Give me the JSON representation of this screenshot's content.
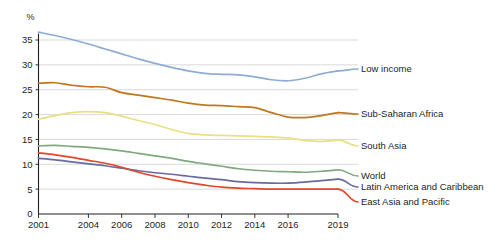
{
  "chart_data": {
    "type": "line",
    "title": "",
    "subtitle": "",
    "xlabel": "",
    "ylabel": "%",
    "ylim": [
      0,
      37.5
    ],
    "xlim": [
      2001,
      2019
    ],
    "grid": true,
    "legend_position": "right-inline",
    "yticks": [
      0,
      5,
      10,
      15,
      20,
      25,
      30,
      35
    ],
    "ytick_labels": [
      "0",
      "5",
      "10",
      "15",
      "20",
      "25",
      "30",
      "35"
    ],
    "xticks": [
      2001,
      2004,
      2006,
      2008,
      2010,
      2012,
      2014,
      2016,
      2019
    ],
    "xtick_labels": [
      "2001",
      "2004",
      "2006",
      "2008",
      "2010",
      "2012",
      "2014",
      "2016",
      "2019"
    ],
    "x": [
      2001,
      2002,
      2003,
      2004,
      2005,
      2006,
      2007,
      2008,
      2009,
      2010,
      2011,
      2012,
      2013,
      2014,
      2015,
      2016,
      2017,
      2018,
      2019
    ],
    "series": [
      {
        "name": "Low income",
        "color": "#8fadd4",
        "label": "Low income",
        "values": [
          36.6,
          35.9,
          35.1,
          34.2,
          33.2,
          32.2,
          31.2,
          30.3,
          29.5,
          28.8,
          28.3,
          28.1,
          28.0,
          27.6,
          27.0,
          26.8,
          27.3,
          28.2,
          28.8
        ]
      },
      {
        "name": "Sub-Saharan Africa",
        "color": "#c0781e",
        "label": "Sub-Saharan Africa",
        "values": [
          26.3,
          26.4,
          25.9,
          25.6,
          25.5,
          24.4,
          23.9,
          23.4,
          22.9,
          22.3,
          21.9,
          21.8,
          21.6,
          21.4,
          20.4,
          19.5,
          19.4,
          19.8,
          20.4
        ]
      },
      {
        "name": "South Asia",
        "color": "#e9e083",
        "label": "South Asia",
        "values": [
          19.1,
          19.8,
          20.4,
          20.6,
          20.4,
          19.7,
          18.8,
          18.0,
          17.0,
          16.2,
          15.9,
          15.8,
          15.7,
          15.6,
          15.5,
          15.3,
          14.8,
          14.6,
          14.9
        ]
      },
      {
        "name": "World",
        "color": "#7fa97f",
        "label": "World",
        "values": [
          13.7,
          13.8,
          13.6,
          13.4,
          13.1,
          12.7,
          12.2,
          11.7,
          11.2,
          10.6,
          10.1,
          9.6,
          9.1,
          8.8,
          8.6,
          8.5,
          8.4,
          8.6,
          8.9
        ]
      },
      {
        "name": "Latin America and Caribbean",
        "color": "#6a6a9e",
        "label": "Latin America and Caribbean",
        "values": [
          11.2,
          10.9,
          10.5,
          10.1,
          9.7,
          9.2,
          8.7,
          8.3,
          8.0,
          7.6,
          7.2,
          6.9,
          6.5,
          6.3,
          6.2,
          6.2,
          6.4,
          6.7,
          7.0
        ]
      },
      {
        "name": "East Asia and Pacific",
        "color": "#e0472c",
        "label": "East Asia and Pacific",
        "values": [
          12.3,
          11.9,
          11.4,
          10.8,
          10.2,
          9.4,
          8.4,
          7.6,
          6.9,
          6.3,
          5.8,
          5.4,
          5.2,
          5.1,
          5.0,
          5.0,
          5.0,
          5.0,
          5.0
        ]
      }
    ]
  }
}
